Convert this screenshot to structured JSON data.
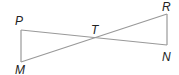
{
  "diagram": {
    "points": {
      "P": {
        "label": "P",
        "x": 21,
        "y": 30
      },
      "M": {
        "label": "M",
        "x": 21,
        "y": 62
      },
      "T": {
        "label": "T",
        "x": 95,
        "y": 37
      },
      "R": {
        "label": "R",
        "x": 167,
        "y": 14
      },
      "N": {
        "label": "N",
        "x": 167,
        "y": 45
      }
    },
    "segments": [
      "PN",
      "MR",
      "PM",
      "RN"
    ],
    "line_color": "#999999",
    "label_color": "#222222"
  }
}
